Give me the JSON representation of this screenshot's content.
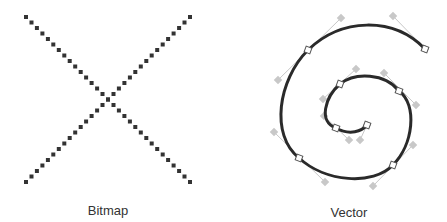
{
  "panels": [
    {
      "id": "bitmap",
      "label": "Bitmap",
      "label_pos": {
        "x": 108,
        "y": 203
      },
      "pixel_color": "#333333",
      "pixel_size": 4,
      "lines": [
        {
          "from": [
            26,
            17
          ],
          "to": [
            190,
            182
          ],
          "count": 31
        },
        {
          "from": [
            190,
            17
          ],
          "to": [
            26,
            182
          ],
          "count": 31
        }
      ]
    },
    {
      "id": "vector",
      "label": "Vector",
      "label_pos": {
        "x": 349,
        "y": 205
      },
      "stroke_color": "#2a2a2a",
      "handle_color": "#c8c8c8",
      "path": "M 425 49 C 393 16, 341 18, 308 50 C 278 80, 270 135, 299 158 C 325 182, 373 186, 393 165 C 413 145, 418 105, 399 91 C 385 73, 355 72, 340 84 C 325 97, 318 122, 336 128 C 350 136, 362 131, 367 125",
      "anchors": [
        [
          425,
          49
        ],
        [
          308,
          50
        ],
        [
          299,
          158
        ],
        [
          393,
          165
        ],
        [
          399,
          91
        ],
        [
          340,
          84
        ],
        [
          336,
          128
        ],
        [
          367,
          125
        ]
      ],
      "handles": [
        [
          [
            425,
            49
          ],
          [
            393,
            16
          ]
        ],
        [
          [
            341,
            18
          ],
          [
            278,
            80
          ]
        ],
        [
          [
            274,
            132
          ],
          [
            325,
            182
          ]
        ],
        [
          [
            373,
            186
          ],
          [
            413,
            145
          ]
        ],
        [
          [
            416,
            105
          ],
          [
            384,
            73
          ]
        ],
        [
          [
            356,
            69
          ],
          [
            323,
            99
          ]
        ],
        [
          [
            324,
            116
          ],
          [
            349,
            140
          ]
        ],
        [
          [
            360,
            140
          ],
          [
            367,
            125
          ]
        ]
      ]
    }
  ]
}
